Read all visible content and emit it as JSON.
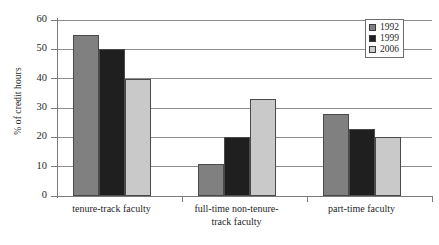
{
  "chart_data": {
    "type": "bar",
    "title": "",
    "subtitle": "",
    "xlabel": "",
    "ylabel": "% of credit hours",
    "ylim": [
      0,
      60
    ],
    "yticks": [
      0,
      10,
      20,
      30,
      40,
      50,
      60
    ],
    "grid": true,
    "legend_position": "top-right",
    "categories": [
      "tenure-track faculty",
      "full-time non-tenure-track faculty",
      "part-time faculty"
    ],
    "category_lines": [
      [
        "tenure-track faculty"
      ],
      [
        "full-time non-tenure-",
        "track faculty"
      ],
      [
        "part-time faculty"
      ]
    ],
    "series": [
      {
        "name": "1992",
        "color": "#808080",
        "values": [
          55,
          11,
          28
        ]
      },
      {
        "name": "1999",
        "color": "#1f1f1f",
        "values": [
          50,
          20,
          23
        ]
      },
      {
        "name": "2006",
        "color": "#c9c9c9",
        "values": [
          40,
          33,
          20
        ]
      }
    ]
  },
  "legend": {
    "entries": [
      {
        "label": "1992",
        "color": "#808080"
      },
      {
        "label": "1999",
        "color": "#1f1f1f"
      },
      {
        "label": "2006",
        "color": "#c9c9c9"
      }
    ]
  }
}
